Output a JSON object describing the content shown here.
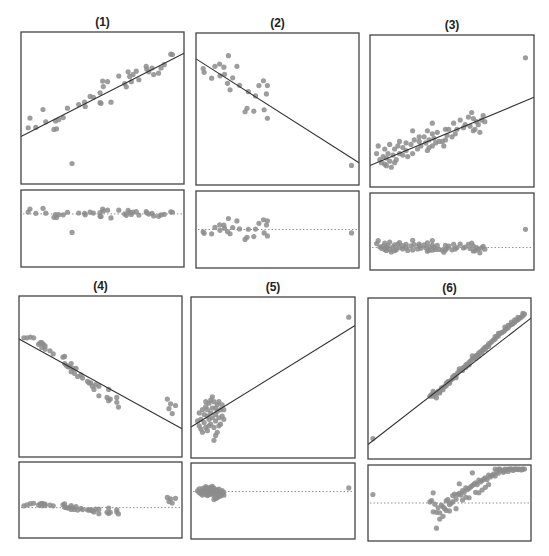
{
  "chart_data": [
    {
      "type": "scatter",
      "title": "(1)",
      "xlabel": "",
      "ylabel": "",
      "grid": false,
      "box": {
        "x": 21,
        "y": 32,
        "w": 163,
        "h": 152
      },
      "resid_box": {
        "x": 21,
        "y": 190,
        "w": 163,
        "h": 77
      },
      "fit_line": {
        "y0": 0.312,
        "y1": 0.86
      },
      "points": [
        [
          0.044,
          0.37
        ],
        [
          0.055,
          0.434
        ],
        [
          0.091,
          0.372
        ],
        [
          0.135,
          0.49
        ],
        [
          0.152,
          0.409
        ],
        [
          0.202,
          0.359
        ],
        [
          0.218,
          0.363
        ],
        [
          0.212,
          0.415
        ],
        [
          0.232,
          0.424
        ],
        [
          0.259,
          0.437
        ],
        [
          0.285,
          0.499
        ],
        [
          0.354,
          0.523
        ],
        [
          0.394,
          0.51
        ],
        [
          0.39,
          0.538
        ],
        [
          0.424,
          0.576
        ],
        [
          0.444,
          0.57
        ],
        [
          0.485,
          0.6
        ],
        [
          0.485,
          0.535
        ],
        [
          0.491,
          0.531
        ],
        [
          0.501,
          0.677
        ],
        [
          0.531,
          0.673
        ],
        [
          0.505,
          0.641
        ],
        [
          0.552,
          0.538
        ],
        [
          0.6,
          0.71
        ],
        [
          0.636,
          0.66
        ],
        [
          0.646,
          0.639
        ],
        [
          0.657,
          0.738
        ],
        [
          0.667,
          0.708
        ],
        [
          0.687,
          0.72
        ],
        [
          0.707,
          0.742
        ],
        [
          0.723,
          0.686
        ],
        [
          0.677,
          0.673
        ],
        [
          0.768,
          0.774
        ],
        [
          0.772,
          0.755
        ],
        [
          0.784,
          0.738
        ],
        [
          0.804,
          0.763
        ],
        [
          0.814,
          0.72
        ],
        [
          0.844,
          0.729
        ],
        [
          0.859,
          0.763
        ],
        [
          0.879,
          0.785
        ],
        [
          0.919,
          0.854
        ],
        [
          0.929,
          0.852
        ],
        [
          0.313,
          0.135
        ]
      ],
      "resid_range": [
        -1.0,
        0.45
      ]
    },
    {
      "type": "scatter",
      "title": "(2)",
      "xlabel": "",
      "ylabel": "",
      "grid": false,
      "box": {
        "x": 196,
        "y": 33,
        "w": 163,
        "h": 152
      },
      "resid_box": {
        "x": 196,
        "y": 191,
        "w": 163,
        "h": 77
      },
      "fit_line": {
        "y0": 0.83,
        "y1": 0.146
      },
      "points": [
        [
          0.044,
          0.766
        ],
        [
          0.05,
          0.741
        ],
        [
          0.096,
          0.703
        ],
        [
          0.116,
          0.781
        ],
        [
          0.145,
          0.796
        ],
        [
          0.147,
          0.718
        ],
        [
          0.171,
          0.775
        ],
        [
          0.175,
          0.728
        ],
        [
          0.199,
          0.851
        ],
        [
          0.193,
          0.669
        ],
        [
          0.209,
          0.626
        ],
        [
          0.225,
          0.705
        ],
        [
          0.251,
          0.781
        ],
        [
          0.267,
          0.656
        ],
        [
          0.321,
          0.614
        ],
        [
          0.365,
          0.586
        ],
        [
          0.386,
          0.654
        ],
        [
          0.414,
          0.686
        ],
        [
          0.438,
          0.654
        ],
        [
          0.432,
          0.599
        ],
        [
          0.301,
          0.482
        ],
        [
          0.313,
          0.505
        ],
        [
          0.355,
          0.486
        ],
        [
          0.418,
          0.495
        ],
        [
          0.438,
          0.439
        ],
        [
          0.954,
          0.129
        ]
      ],
      "resid_range": [
        -0.55,
        0.55
      ]
    },
    {
      "type": "scatter",
      "title": "(3)",
      "xlabel": "",
      "ylabel": "",
      "grid": false,
      "box": {
        "x": 370,
        "y": 35,
        "w": 164,
        "h": 152
      },
      "resid_box": {
        "x": 370,
        "y": 193,
        "w": 164,
        "h": 77
      },
      "fit_line": {
        "y0": 0.141,
        "y1": 0.59
      },
      "points": [
        [
          0.948,
          0.85
        ],
        [
          0.04,
          0.22
        ],
        [
          0.06,
          0.18
        ],
        [
          0.07,
          0.16
        ],
        [
          0.08,
          0.2
        ],
        [
          0.09,
          0.15
        ],
        [
          0.1,
          0.19
        ],
        [
          0.1,
          0.14
        ],
        [
          0.11,
          0.22
        ],
        [
          0.12,
          0.17
        ],
        [
          0.13,
          0.13
        ],
        [
          0.14,
          0.21
        ],
        [
          0.15,
          0.25
        ],
        [
          0.16,
          0.18
        ],
        [
          0.17,
          0.27
        ],
        [
          0.18,
          0.3
        ],
        [
          0.05,
          0.27
        ],
        [
          0.09,
          0.25
        ],
        [
          0.12,
          0.28
        ],
        [
          0.2,
          0.21
        ],
        [
          0.22,
          0.24
        ],
        [
          0.23,
          0.2
        ],
        [
          0.25,
          0.28
        ],
        [
          0.26,
          0.22
        ],
        [
          0.27,
          0.31
        ],
        [
          0.29,
          0.25
        ],
        [
          0.3,
          0.3
        ],
        [
          0.31,
          0.27
        ],
        [
          0.33,
          0.33
        ],
        [
          0.34,
          0.29
        ],
        [
          0.35,
          0.24
        ],
        [
          0.36,
          0.31
        ],
        [
          0.38,
          0.35
        ],
        [
          0.38,
          0.27
        ],
        [
          0.39,
          0.32
        ],
        [
          0.4,
          0.29
        ],
        [
          0.41,
          0.36
        ],
        [
          0.42,
          0.3
        ],
        [
          0.26,
          0.37
        ],
        [
          0.3,
          0.33
        ],
        [
          0.36,
          0.26
        ],
        [
          0.44,
          0.3
        ],
        [
          0.46,
          0.31
        ],
        [
          0.47,
          0.34
        ],
        [
          0.48,
          0.38
        ],
        [
          0.5,
          0.33
        ],
        [
          0.52,
          0.35
        ],
        [
          0.46,
          0.38
        ],
        [
          0.45,
          0.27
        ],
        [
          0.53,
          0.38
        ],
        [
          0.55,
          0.44
        ],
        [
          0.57,
          0.39
        ],
        [
          0.58,
          0.41
        ],
        [
          0.6,
          0.46
        ],
        [
          0.61,
          0.4
        ],
        [
          0.63,
          0.45
        ],
        [
          0.65,
          0.43
        ],
        [
          0.66,
          0.41
        ],
        [
          0.68,
          0.44
        ],
        [
          0.7,
          0.43
        ],
        [
          0.38,
          0.42
        ],
        [
          0.51,
          0.42
        ],
        [
          0.62,
          0.49
        ],
        [
          0.69,
          0.47
        ],
        [
          0.63,
          0.37
        ],
        [
          0.67,
          0.36
        ],
        [
          0.64,
          0.38
        ],
        [
          0.35,
          0.37
        ],
        [
          0.22,
          0.29
        ],
        [
          0.2,
          0.26
        ],
        [
          0.15,
          0.16
        ],
        [
          0.18,
          0.22
        ]
      ],
      "resid_range": [
        -0.35,
        0.85
      ]
    },
    {
      "type": "scatter",
      "title": "(4)",
      "xlabel": "",
      "ylabel": "",
      "grid": false,
      "box": {
        "x": 19,
        "y": 296,
        "w": 163,
        "h": 161
      },
      "resid_box": {
        "x": 19,
        "y": 462,
        "w": 163,
        "h": 76
      },
      "fit_line": {
        "y0": 0.733,
        "y1": 0.176
      },
      "points": [
        [
          0.03,
          0.74
        ],
        [
          0.05,
          0.74
        ],
        [
          0.07,
          0.745
        ],
        [
          0.09,
          0.74
        ],
        [
          0.12,
          0.7
        ],
        [
          0.13,
          0.71
        ],
        [
          0.14,
          0.71
        ],
        [
          0.15,
          0.7
        ],
        [
          0.16,
          0.69
        ],
        [
          0.14,
          0.68
        ],
        [
          0.16,
          0.67
        ],
        [
          0.19,
          0.66
        ],
        [
          0.21,
          0.64
        ],
        [
          0.27,
          0.62
        ],
        [
          0.28,
          0.625
        ],
        [
          0.28,
          0.58
        ],
        [
          0.29,
          0.57
        ],
        [
          0.3,
          0.56
        ],
        [
          0.31,
          0.56
        ],
        [
          0.32,
          0.58
        ],
        [
          0.33,
          0.55
        ],
        [
          0.32,
          0.53
        ],
        [
          0.34,
          0.52
        ],
        [
          0.35,
          0.55
        ],
        [
          0.36,
          0.5
        ],
        [
          0.38,
          0.51
        ],
        [
          0.39,
          0.49
        ],
        [
          0.42,
          0.47
        ],
        [
          0.43,
          0.46
        ],
        [
          0.44,
          0.46
        ],
        [
          0.45,
          0.44
        ],
        [
          0.46,
          0.42
        ],
        [
          0.47,
          0.45
        ],
        [
          0.49,
          0.44
        ],
        [
          0.49,
          0.38
        ],
        [
          0.55,
          0.42
        ],
        [
          0.54,
          0.37
        ],
        [
          0.55,
          0.35
        ],
        [
          0.56,
          0.36
        ],
        [
          0.6,
          0.37
        ],
        [
          0.6,
          0.34
        ],
        [
          0.61,
          0.31
        ],
        [
          0.91,
          0.36
        ],
        [
          0.93,
          0.33
        ],
        [
          0.96,
          0.32
        ],
        [
          0.92,
          0.3
        ],
        [
          0.94,
          0.27
        ]
      ],
      "resid_range": [
        -0.4,
        0.6
      ]
    },
    {
      "type": "scatter",
      "title": "(5)",
      "xlabel": "",
      "ylabel": "",
      "grid": false,
      "box": {
        "x": 191,
        "y": 297,
        "w": 164,
        "h": 161
      },
      "resid_box": {
        "x": 191,
        "y": 463,
        "w": 164,
        "h": 76
      },
      "fit_line": {
        "y0": 0.192,
        "y1": 0.823
      },
      "points": [
        [
          0.962,
          0.875
        ],
        [
          0.05,
          0.28
        ],
        [
          0.06,
          0.24
        ],
        [
          0.07,
          0.3
        ],
        [
          0.08,
          0.22
        ],
        [
          0.08,
          0.27
        ],
        [
          0.09,
          0.32
        ],
        [
          0.09,
          0.19
        ],
        [
          0.1,
          0.26
        ],
        [
          0.1,
          0.3
        ],
        [
          0.11,
          0.24
        ],
        [
          0.11,
          0.34
        ],
        [
          0.12,
          0.21
        ],
        [
          0.12,
          0.28
        ],
        [
          0.13,
          0.31
        ],
        [
          0.13,
          0.25
        ],
        [
          0.14,
          0.19
        ],
        [
          0.14,
          0.35
        ],
        [
          0.15,
          0.27
        ],
        [
          0.15,
          0.23
        ],
        [
          0.16,
          0.33
        ],
        [
          0.16,
          0.29
        ],
        [
          0.17,
          0.25
        ],
        [
          0.17,
          0.35
        ],
        [
          0.18,
          0.21
        ],
        [
          0.18,
          0.3
        ],
        [
          0.19,
          0.26
        ],
        [
          0.19,
          0.33
        ],
        [
          0.2,
          0.24
        ],
        [
          0.06,
          0.18
        ],
        [
          0.07,
          0.16
        ],
        [
          0.1,
          0.17
        ],
        [
          0.13,
          0.38
        ],
        [
          0.15,
          0.14
        ],
        [
          0.14,
          0.11
        ],
        [
          0.16,
          0.16
        ],
        [
          0.12,
          0.36
        ],
        [
          0.09,
          0.35
        ],
        [
          0.04,
          0.23
        ],
        [
          0.05,
          0.2
        ],
        [
          0.2,
          0.3
        ],
        [
          0.17,
          0.2
        ],
        [
          0.11,
          0.2
        ],
        [
          0.15,
          0.31
        ]
      ],
      "resid_range": [
        -1.0,
        0.6
      ]
    },
    {
      "type": "scatter",
      "title": "(6)",
      "xlabel": "",
      "ylabel": "",
      "grid": false,
      "box": {
        "x": 368,
        "y": 298,
        "w": 163,
        "h": 161
      },
      "resid_box": {
        "x": 368,
        "y": 465,
        "w": 163,
        "h": 76
      },
      "fit_line": {
        "y0": 0.09,
        "y1": 0.875
      },
      "points": [
        [
          0.03,
          0.127
        ],
        [
          0.38,
          0.39
        ],
        [
          0.39,
          0.4
        ],
        [
          0.4,
          0.39
        ],
        [
          0.41,
          0.41
        ],
        [
          0.42,
          0.405
        ],
        [
          0.43,
          0.42
        ],
        [
          0.44,
          0.42
        ],
        [
          0.45,
          0.44
        ],
        [
          0.46,
          0.445
        ],
        [
          0.47,
          0.45
        ],
        [
          0.48,
          0.47
        ],
        [
          0.49,
          0.48
        ],
        [
          0.5,
          0.48
        ],
        [
          0.51,
          0.49
        ],
        [
          0.52,
          0.51
        ],
        [
          0.53,
          0.52
        ],
        [
          0.54,
          0.52
        ],
        [
          0.55,
          0.535
        ],
        [
          0.56,
          0.545
        ],
        [
          0.57,
          0.55
        ],
        [
          0.58,
          0.565
        ],
        [
          0.59,
          0.57
        ],
        [
          0.6,
          0.585
        ],
        [
          0.61,
          0.59
        ],
        [
          0.62,
          0.6
        ],
        [
          0.63,
          0.61
        ],
        [
          0.64,
          0.62
        ],
        [
          0.65,
          0.63
        ],
        [
          0.66,
          0.64
        ],
        [
          0.67,
          0.645
        ],
        [
          0.68,
          0.66
        ],
        [
          0.69,
          0.665
        ],
        [
          0.7,
          0.675
        ],
        [
          0.71,
          0.685
        ],
        [
          0.72,
          0.695
        ],
        [
          0.73,
          0.7
        ],
        [
          0.74,
          0.715
        ],
        [
          0.75,
          0.72
        ],
        [
          0.76,
          0.73
        ],
        [
          0.77,
          0.74
        ],
        [
          0.78,
          0.745
        ],
        [
          0.79,
          0.76
        ],
        [
          0.8,
          0.765
        ],
        [
          0.81,
          0.78
        ],
        [
          0.82,
          0.785
        ],
        [
          0.83,
          0.79
        ],
        [
          0.84,
          0.8
        ],
        [
          0.85,
          0.81
        ],
        [
          0.86,
          0.815
        ],
        [
          0.87,
          0.83
        ],
        [
          0.88,
          0.835
        ],
        [
          0.89,
          0.84
        ],
        [
          0.9,
          0.85
        ],
        [
          0.91,
          0.86
        ],
        [
          0.92,
          0.865
        ],
        [
          0.93,
          0.875
        ],
        [
          0.94,
          0.88
        ],
        [
          0.95,
          0.89
        ],
        [
          0.96,
          0.9
        ],
        [
          0.4,
          0.42
        ],
        [
          0.44,
          0.41
        ],
        [
          0.5,
          0.47
        ],
        [
          0.56,
          0.56
        ],
        [
          0.62,
          0.585
        ],
        [
          0.68,
          0.64
        ],
        [
          0.74,
          0.7
        ],
        [
          0.8,
          0.78
        ],
        [
          0.86,
          0.83
        ],
        [
          0.92,
          0.88
        ],
        [
          0.42,
          0.38
        ],
        [
          0.48,
          0.455
        ],
        [
          0.54,
          0.505
        ],
        [
          0.6,
          0.57
        ],
        [
          0.66,
          0.625
        ],
        [
          0.72,
          0.68
        ],
        [
          0.78,
          0.76
        ],
        [
          0.84,
          0.82
        ],
        [
          0.9,
          0.865
        ],
        [
          0.95,
          0.905
        ],
        [
          0.7,
          0.66
        ],
        [
          0.58,
          0.55
        ],
        [
          0.46,
          0.43
        ],
        [
          0.88,
          0.85
        ],
        [
          0.64,
          0.64
        ],
        [
          0.52,
          0.5
        ]
      ],
      "resid_range": [
        -0.06,
        0.06
      ]
    }
  ]
}
